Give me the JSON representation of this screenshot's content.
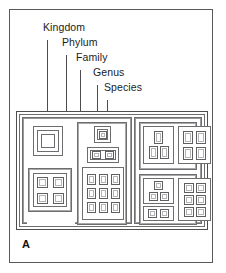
{
  "figure": {
    "panel_letter": "A",
    "title_hidden": "",
    "line_color": "#4e4e50",
    "background": "#ffffff"
  },
  "labels": [
    {
      "id": "kingdom",
      "text": "Kingdom",
      "x": 33,
      "y": 17,
      "leader_x": 37,
      "leader_top": 30,
      "leader_bottom": 101
    },
    {
      "id": "phylum",
      "text": "Phylum",
      "x": 52,
      "y": 32,
      "leader_x": 56,
      "leader_top": 45,
      "leader_bottom": 101
    },
    {
      "id": "family",
      "text": "Family",
      "x": 66,
      "y": 47,
      "leader_x": 70,
      "leader_top": 60,
      "leader_bottom": 113
    },
    {
      "id": "genus",
      "text": "Genus",
      "x": 83,
      "y": 62,
      "leader_x": 87,
      "leader_top": 75,
      "leader_bottom": 121
    },
    {
      "id": "species",
      "text": "Species",
      "x": 94,
      "y": 77,
      "leader_x": 97,
      "leader_top": 90,
      "leader_bottom": 124
    }
  ],
  "diagram": {
    "kingdoms": [
      {
        "id": "kingdom-left",
        "phyla": [
          {
            "id": "phylum-left-a",
            "families": [
              {
                "id": "family-ring",
                "type": "nested-ring",
                "genera": [
                  {
                    "id": "genus-ring",
                    "species_count": 1
                  }
                ]
              },
              {
                "id": "family-left-lower",
                "type": "grid",
                "genera": [
                  {
                    "id": "genus-left-lower",
                    "species_count": 4,
                    "cols": 2,
                    "rows": 2
                  }
                ]
              }
            ]
          },
          {
            "id": "phylum-left-b",
            "families": [
              {
                "id": "family-species-one",
                "type": "grid",
                "genera": [
                  {
                    "id": "genus-one",
                    "species_count": 1,
                    "cols": 1,
                    "rows": 1
                  }
                ]
              },
              {
                "id": "family-pair",
                "type": "grid",
                "genera": [
                  {
                    "id": "genus-pair",
                    "species_count": 2,
                    "cols": 2,
                    "rows": 1
                  }
                ]
              },
              {
                "id": "family-nine",
                "type": "grid",
                "genera": [
                  {
                    "id": "genus-nine",
                    "species_count": 9,
                    "cols": 3,
                    "rows": 3
                  }
                ]
              }
            ]
          }
        ]
      },
      {
        "id": "kingdom-right",
        "phyla": [
          {
            "id": "phylum-right-top",
            "families": [
              {
                "id": "family-rt-1",
                "type": "grid",
                "genera": [
                  {
                    "id": "genus-rt-1",
                    "species_count": 3,
                    "cols": 2,
                    "rows": 2
                  }
                ]
              },
              {
                "id": "family-rt-2",
                "type": "grid",
                "genera": [
                  {
                    "id": "genus-rt-2",
                    "species_count": 4,
                    "cols": 2,
                    "rows": 2
                  }
                ]
              }
            ]
          },
          {
            "id": "phylum-right-bottom",
            "families": [
              {
                "id": "family-rb-1",
                "type": "grid",
                "genera": [
                  {
                    "id": "genus-rb-1",
                    "species_count": 3,
                    "cols": 2,
                    "rows": 2
                  }
                ]
              },
              {
                "id": "family-rb-2",
                "type": "grid",
                "genera": [
                  {
                    "id": "genus-rb-2",
                    "species_count": 2,
                    "cols": 2,
                    "rows": 1
                  }
                ]
              },
              {
                "id": "family-rb-3",
                "type": "grid",
                "genera": [
                  {
                    "id": "genus-rb-3",
                    "species_count": 6,
                    "cols": 2,
                    "rows": 3
                  }
                ]
              }
            ]
          }
        ]
      }
    ]
  }
}
